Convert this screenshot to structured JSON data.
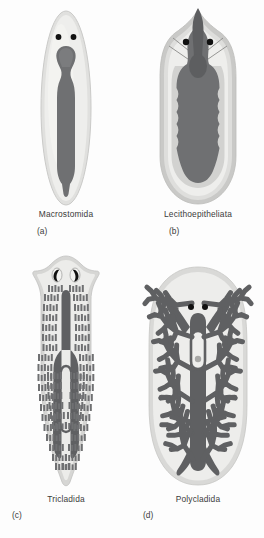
{
  "figure": {
    "background_color": "#fdfdfd",
    "palette": {
      "body_outer": "#e3e3e1",
      "body_inner": "#eeeeec",
      "body_highlight": "#f4f4f2",
      "gut_dark": "#6f7072",
      "gut_darker": "#5e5f61",
      "pharynx": "#808184",
      "eyespot": "#111111",
      "outline": "#c9c9c7",
      "label_text": "#3b3b3b"
    },
    "panels": [
      {
        "letter": "(a)",
        "taxon": "Macrostomida",
        "gut_type": "simple sac",
        "body_shape": "elongate ellipse",
        "eyespots": 2,
        "eyespot_shape": "round dot",
        "diverticula": 0
      },
      {
        "letter": "(b)",
        "taxon": "Lecithoepitheliata",
        "gut_type": "lobed sac",
        "body_shape": "broad oval with pointed head",
        "eyespots": 2,
        "eyespot_shape": "round dot",
        "diverticula": 0
      },
      {
        "letter": "(c)",
        "taxon": "Tricladida",
        "gut_type": "three-branched",
        "body_shape": "arrow-shaped head, tapering tail",
        "eyespots": 2,
        "eyespot_shape": "crescent",
        "diverticula": "many lateral"
      },
      {
        "letter": "(d)",
        "taxon": "Polycladida",
        "gut_type": "many-branched",
        "body_shape": "broad oval",
        "eyespots": 2,
        "eyespot_shape": "round dot",
        "diverticula": "highly ramified"
      }
    ]
  }
}
